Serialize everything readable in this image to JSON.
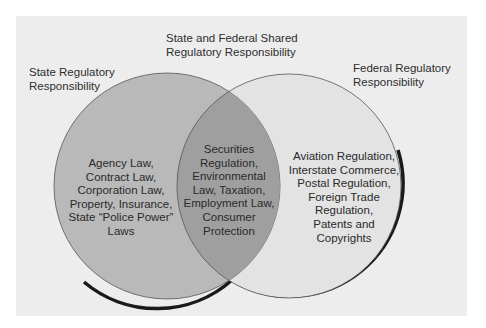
{
  "diagram": {
    "type": "venn",
    "colors": {
      "page_background": "#ffffff",
      "panel_background": "#ededed",
      "state_circle_fill": "#b9b9b9",
      "federal_circle_fill": "#e3e3e3",
      "overlap_fill": "#9f9f9f",
      "outline": "#555555",
      "shadow": "#1a1a1a"
    },
    "labels": {
      "state": [
        "State Regulatory",
        "Responsibility"
      ],
      "shared": [
        "State and Federal Shared",
        "Regulatory Responsibility"
      ],
      "federal": [
        "Federal Regulatory",
        "Responsibility"
      ]
    },
    "regions": {
      "state_only": [
        "Agency Law,",
        "Contract Law,",
        "Corporation Law,",
        "Property, Insurance,",
        "State “Police Power”",
        "Laws"
      ],
      "shared": [
        "Securities",
        "Regulation,",
        "Environmental",
        "Law, Taxation,",
        "Employment Law,",
        "Consumer",
        "Protection"
      ],
      "federal_only": [
        "Aviation Regulation,",
        "Interstate Commerce,",
        "Postal Regulation,",
        "Foreign Trade",
        "Regulation,",
        "Patents and",
        "Copyrights"
      ]
    }
  }
}
